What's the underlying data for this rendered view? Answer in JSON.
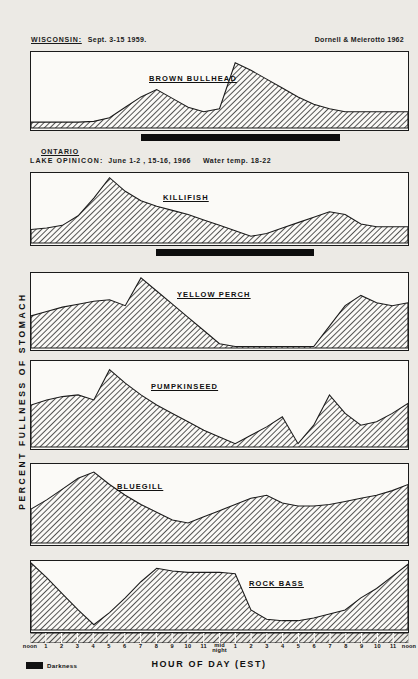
{
  "figure": {
    "y_axis_title": "PERCENT  FULLNESS  OF  STOMACH",
    "x_axis_title": "HOUR OF DAY (EST)",
    "darkness_legend_label": "Darkness",
    "hatch_color": "#1b1b1b",
    "dark_color": "#0d0d0d"
  },
  "headers": {
    "wisconsin": {
      "region": "WISCONSIN:",
      "dates": "Sept. 3-15 1959.",
      "credit": "Dornell & Meierotto 1962"
    },
    "ontario": {
      "region": "ONTARIO",
      "lake": "LAKE  OPINICON:",
      "dates": "June 1-2 , 15-16, 1966",
      "water_temp": "Water temp.  18-22"
    }
  },
  "axis": {
    "ticks": [
      "noon",
      "1",
      "2",
      "3",
      "4",
      "5",
      "6",
      "7",
      "8",
      "9",
      "10",
      "11",
      "mid\nnight",
      "1",
      "2",
      "3",
      "4",
      "5",
      "6",
      "7",
      "8",
      "9",
      "10",
      "11",
      "noon"
    ],
    "labels": [
      {
        "t": "noon",
        "x": 0
      },
      {
        "t": "1",
        "x": 1
      },
      {
        "t": "2",
        "x": 2
      },
      {
        "t": "3",
        "x": 3
      },
      {
        "t": "4",
        "x": 4
      },
      {
        "t": "5",
        "x": 5
      },
      {
        "t": "6",
        "x": 6
      },
      {
        "t": "7",
        "x": 7
      },
      {
        "t": "8",
        "x": 8
      },
      {
        "t": "9",
        "x": 9
      },
      {
        "t": "10",
        "x": 10
      },
      {
        "t": "11",
        "x": 11
      },
      {
        "t": "mid",
        "t2": "night",
        "x": 12
      },
      {
        "t": "1",
        "x": 13
      },
      {
        "t": "2",
        "x": 14
      },
      {
        "t": "3",
        "x": 15
      },
      {
        "t": "4",
        "x": 16
      },
      {
        "t": "5",
        "x": 17
      },
      {
        "t": "6",
        "x": 18
      },
      {
        "t": "7",
        "x": 19
      },
      {
        "t": "8",
        "x": 20
      },
      {
        "t": "9",
        "x": 21
      },
      {
        "t": "10",
        "x": 22
      },
      {
        "t": "11",
        "x": 23
      },
      {
        "t": "noon",
        "x": 24
      }
    ]
  },
  "chart_data": {
    "type": "area",
    "xlabel": "HOUR OF DAY (EST)",
    "ylabel": "PERCENT FULLNESS OF STOMACH",
    "x": [
      0,
      1,
      2,
      3,
      4,
      5,
      6,
      7,
      8,
      9,
      10,
      11,
      12,
      13,
      14,
      15,
      16,
      17,
      18,
      19,
      20,
      21,
      22,
      23,
      24
    ],
    "x_tick_labels": [
      "noon",
      "1",
      "2",
      "3",
      "4",
      "5",
      "6",
      "7",
      "8",
      "9",
      "10",
      "11",
      "mid night",
      "1",
      "2",
      "3",
      "4",
      "5",
      "6",
      "7",
      "8",
      "9",
      "10",
      "11",
      "noon"
    ],
    "ylim": [
      0,
      100
    ],
    "grid": false,
    "legend": "none",
    "series": [
      {
        "name": "BROWN  BULLHEAD",
        "site": "WISCONSIN",
        "values": [
          8,
          8,
          8,
          8,
          9,
          14,
          28,
          42,
          52,
          40,
          28,
          22,
          26,
          88,
          78,
          66,
          54,
          42,
          32,
          26,
          22,
          22,
          22,
          22,
          22
        ],
        "darkness": {
          "start": 7.0,
          "end": 19.6
        }
      },
      {
        "name": "KILLIFISH",
        "site": "LAKE OPINICON",
        "values": [
          20,
          22,
          26,
          40,
          66,
          96,
          76,
          62,
          54,
          48,
          42,
          34,
          26,
          18,
          10,
          14,
          22,
          30,
          38,
          46,
          42,
          28,
          24,
          24,
          24
        ],
        "darkness": {
          "start": 8.0,
          "end": 18.0
        }
      },
      {
        "name": "YELLOW  PERCH",
        "site": "LAKE OPINICON",
        "values": [
          44,
          50,
          56,
          60,
          64,
          66,
          58,
          96,
          78,
          60,
          42,
          24,
          6,
          2,
          2,
          2,
          2,
          2,
          2,
          30,
          58,
          72,
          62,
          58,
          62
        ],
        "darkness": null
      },
      {
        "name": "PUMPKINSEED",
        "site": "LAKE OPINICON",
        "values": [
          50,
          56,
          60,
          62,
          56,
          92,
          76,
          62,
          50,
          40,
          30,
          20,
          12,
          4,
          14,
          24,
          36,
          4,
          26,
          62,
          40,
          26,
          30,
          40,
          52
        ],
        "darkness": null
      },
      {
        "name": "BLUEGILL",
        "site": "LAKE OPINICON",
        "values": [
          44,
          56,
          70,
          84,
          92,
          76,
          62,
          50,
          40,
          30,
          26,
          34,
          42,
          50,
          58,
          62,
          52,
          48,
          48,
          50,
          54,
          58,
          62,
          68,
          76
        ],
        "darkness": null
      },
      {
        "name": "ROCK  BASS",
        "site": "LAKE OPINICON",
        "values": [
          100,
          78,
          54,
          30,
          8,
          26,
          48,
          72,
          92,
          88,
          86,
          86,
          86,
          84,
          30,
          16,
          14,
          14,
          18,
          24,
          30,
          48,
          62,
          80,
          98
        ],
        "darkness": null
      }
    ]
  },
  "panels": [
    {
      "id": "brown-bullhead",
      "label": "BROWN   BULLHEAD",
      "label_left": "118px",
      "label_top": "22px"
    },
    {
      "id": "killifish",
      "label": "KILLIFISH",
      "label_left": "132px",
      "label_top": "20px"
    },
    {
      "id": "yellow-perch",
      "label": "YELLOW   PERCH",
      "label_left": "146px",
      "label_top": "17px"
    },
    {
      "id": "pumpkinseed",
      "label": "PUMPKINSEED",
      "label_left": "120px",
      "label_top": "21px"
    },
    {
      "id": "bluegill",
      "label": "BLUEGILL",
      "label_left": "86px",
      "label_top": "18px"
    },
    {
      "id": "rock-bass",
      "label": "ROCK   BASS",
      "label_left": "218px",
      "label_top": "18px"
    }
  ]
}
